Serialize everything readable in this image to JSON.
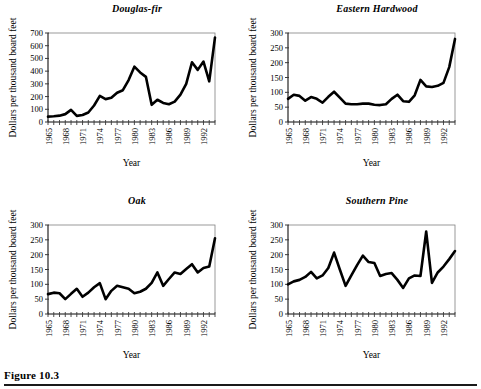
{
  "figure": {
    "caption": "Figure 10.3",
    "rule_color": "#1a1a1a"
  },
  "common": {
    "xlabel": "Year",
    "ylabel": "Dollars per thousand board feet",
    "line_color": "#000000",
    "axis_color": "#808080",
    "x_tick_labels": [
      "1965",
      "1968",
      "1971",
      "1974",
      "1977",
      "1980",
      "1983",
      "1986",
      "1989",
      "1992"
    ],
    "x_tick_every": 1,
    "x_label_every": 3,
    "xlim": [
      1965,
      1994
    ]
  },
  "chart_data": [
    {
      "type": "line",
      "title": "Douglas-fir",
      "xlabel": "Year",
      "ylabel": "Dollars per thousand board feet",
      "ylim": [
        0,
        700
      ],
      "ytick_labels": [
        "0",
        "100",
        "200",
        "300",
        "400",
        "500",
        "600",
        "700"
      ],
      "ytick_values": [
        0,
        100,
        200,
        300,
        400,
        500,
        600,
        700
      ],
      "grid": false,
      "legend": "none",
      "x": [
        1965,
        1966,
        1967,
        1968,
        1969,
        1970,
        1971,
        1972,
        1973,
        1974,
        1975,
        1976,
        1977,
        1978,
        1979,
        1980,
        1981,
        1982,
        1983,
        1984,
        1985,
        1986,
        1987,
        1988,
        1989,
        1990,
        1991,
        1992,
        1993,
        1994
      ],
      "values": [
        42,
        45,
        50,
        62,
        95,
        48,
        55,
        75,
        130,
        205,
        180,
        190,
        230,
        250,
        330,
        435,
        390,
        355,
        135,
        175,
        150,
        140,
        160,
        215,
        300,
        470,
        410,
        475,
        320,
        665
      ]
    },
    {
      "type": "line",
      "title": "Eastern Hardwood",
      "xlabel": "Year",
      "ylabel": "Dollars per thousand board feet",
      "ylim": [
        0,
        300
      ],
      "ytick_labels": [
        "0",
        "50",
        "100",
        "150",
        "200",
        "250",
        "300"
      ],
      "ytick_values": [
        0,
        50,
        100,
        150,
        200,
        250,
        300
      ],
      "grid": false,
      "legend": "none",
      "x": [
        1965,
        1966,
        1967,
        1968,
        1969,
        1970,
        1971,
        1972,
        1973,
        1974,
        1975,
        1976,
        1977,
        1978,
        1979,
        1980,
        1981,
        1982,
        1983,
        1984,
        1985,
        1986,
        1987,
        1988,
        1989,
        1990,
        1991,
        1992,
        1993,
        1994
      ],
      "values": [
        78,
        92,
        88,
        72,
        84,
        78,
        65,
        85,
        102,
        82,
        62,
        60,
        60,
        62,
        62,
        58,
        57,
        60,
        78,
        92,
        70,
        68,
        90,
        142,
        120,
        118,
        122,
        132,
        185,
        280
      ]
    },
    {
      "type": "line",
      "title": "Oak",
      "xlabel": "Year",
      "ylabel": "Dollars per thousand board feet",
      "ylim": [
        0,
        300
      ],
      "ytick_labels": [
        "0",
        "50",
        "100",
        "150",
        "200",
        "250",
        "300"
      ],
      "ytick_values": [
        0,
        50,
        100,
        150,
        200,
        250,
        300
      ],
      "grid": false,
      "legend": "none",
      "x": [
        1965,
        1966,
        1967,
        1968,
        1969,
        1970,
        1971,
        1972,
        1973,
        1974,
        1975,
        1976,
        1977,
        1978,
        1979,
        1980,
        1981,
        1982,
        1983,
        1984,
        1985,
        1986,
        1987,
        1988,
        1989,
        1990,
        1991,
        1992,
        1993,
        1994
      ],
      "values": [
        67,
        72,
        70,
        50,
        68,
        85,
        58,
        72,
        90,
        104,
        50,
        78,
        95,
        90,
        85,
        70,
        75,
        85,
        105,
        140,
        95,
        118,
        140,
        135,
        152,
        168,
        140,
        155,
        160,
        255
      ]
    },
    {
      "type": "line",
      "title": "Southern Pine",
      "xlabel": "Year",
      "ylabel": "Dollars per thousand board feet",
      "ylim": [
        0,
        300
      ],
      "ytick_labels": [
        "0",
        "50",
        "100",
        "150",
        "200",
        "250",
        "300"
      ],
      "ytick_values": [
        0,
        50,
        100,
        150,
        200,
        250,
        300
      ],
      "grid": false,
      "legend": "none",
      "x": [
        1965,
        1966,
        1967,
        1968,
        1969,
        1970,
        1971,
        1972,
        1973,
        1974,
        1975,
        1976,
        1977,
        1978,
        1979,
        1980,
        1981,
        1982,
        1983,
        1984,
        1985,
        1986,
        1987,
        1988,
        1989,
        1990,
        1991,
        1992,
        1993,
        1994
      ],
      "values": [
        100,
        110,
        115,
        125,
        142,
        120,
        130,
        155,
        207,
        150,
        95,
        130,
        165,
        197,
        175,
        172,
        128,
        135,
        138,
        115,
        88,
        120,
        130,
        128,
        278,
        105,
        140,
        160,
        185,
        212
      ]
    }
  ]
}
